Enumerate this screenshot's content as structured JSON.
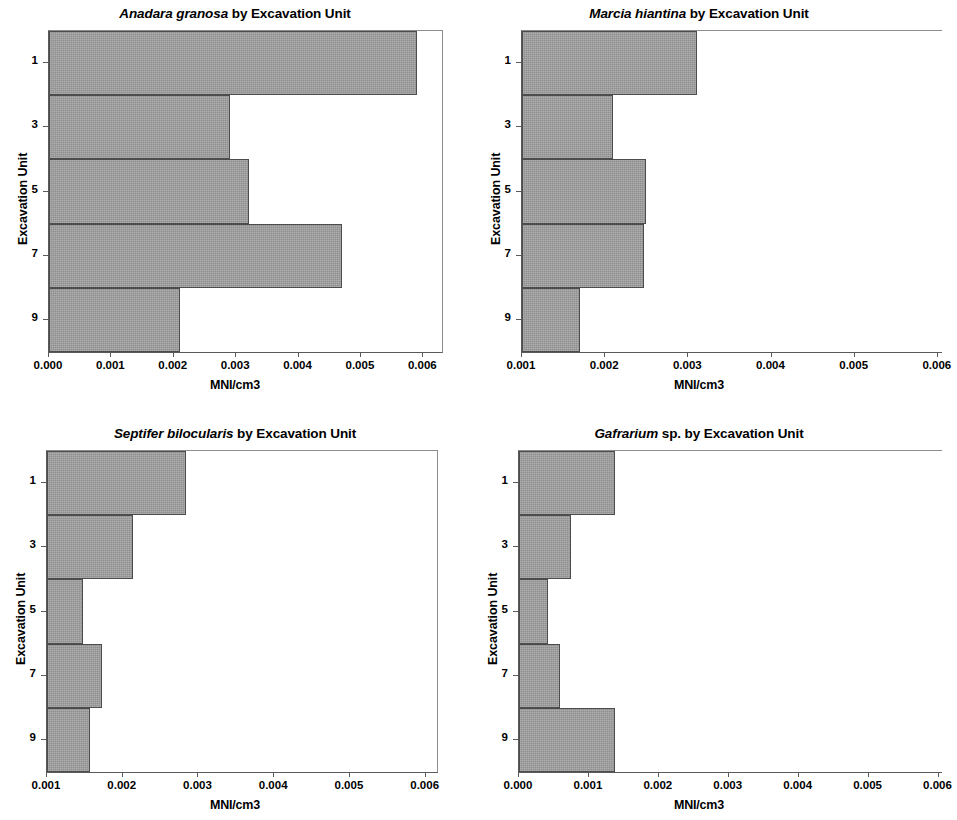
{
  "figure": {
    "axis_title_x": "MNI/cm3",
    "axis_title_y": "Excavation Unit",
    "bar_color": "#9a9a9a",
    "bar_edge_color": "#4c4c4c",
    "title_suffix": "by Excavation Unit"
  },
  "panels": [
    {
      "key": "tl",
      "title_species": "Anadara granosa",
      "title_rest": "by Excavation Unit",
      "title_full": "Anadara granosa  by Excavation Unit"
    },
    {
      "key": "tr",
      "title_species": "Marcia hiantina",
      "title_rest": "by Excavation Unit",
      "title_full": "Marcia hiantina by Excavation Unit"
    },
    {
      "key": "bl",
      "title_species": "Septifer bilocularis",
      "title_rest": "by Excavation Unit",
      "title_full": "Septifer bilocularis  by Excavation Unit"
    },
    {
      "key": "br",
      "title_species": "Gafrarium",
      "title_rest": "sp. by Excavation Unit",
      "title_full": "Gafrarium sp. by Excavation Unit"
    }
  ],
  "chart_data": [
    {
      "type": "bar",
      "orientation": "horizontal",
      "title": "Anadara granosa  by Excavation Unit",
      "xlabel": "MNI/cm3",
      "ylabel": "Excavation Unit",
      "categories": [
        "1",
        "",
        "3",
        "",
        "5",
        "",
        "7",
        "",
        "9"
      ],
      "ytick_labels": [
        "1",
        "3",
        "5",
        "7",
        "9"
      ],
      "values": [
        0.0059,
        0.0029,
        0.0032,
        0.0047,
        0.0021
      ],
      "xlim": [
        0.0,
        0.0063
      ],
      "xticks": [
        0.0,
        0.001,
        0.002,
        0.003,
        0.004,
        0.005,
        0.006
      ],
      "xtick_labels": [
        "0.000",
        "0.001",
        "0.002",
        "0.003",
        "0.004",
        "0.005",
        "0.006"
      ],
      "grid": false,
      "legend": "none",
      "clipped_right": false
    },
    {
      "type": "bar",
      "orientation": "horizontal",
      "title": "Marcia hiantina by Excavation Unit",
      "xlabel": "MNI/cm3",
      "ylabel": "Excavation Unit",
      "ytick_labels": [
        "1",
        "3",
        "5",
        "7",
        "9"
      ],
      "values": [
        0.0031,
        0.0021,
        0.00249,
        0.00247,
        0.0017
      ],
      "xlim": [
        0.001,
        0.00605
      ],
      "xticks": [
        0.001,
        0.002,
        0.003,
        0.004,
        0.005,
        0.006
      ],
      "xtick_labels": [
        "0.001",
        "0.002",
        "0.003",
        "0.004",
        "0.005",
        "0.006"
      ],
      "grid": false,
      "legend": "none",
      "clipped_right": true
    },
    {
      "type": "bar",
      "orientation": "horizontal",
      "title": "Septifer bilocularis  by Excavation Unit",
      "xlabel": "MNI/cm3",
      "ylabel": "Excavation Unit",
      "ytick_labels": [
        "1",
        "3",
        "5",
        "7",
        "9"
      ],
      "values": [
        0.00284,
        0.00214,
        0.00147,
        0.00173,
        0.00157
      ],
      "xlim": [
        0.001,
        0.00615
      ],
      "xticks": [
        0.001,
        0.002,
        0.003,
        0.004,
        0.005,
        0.006
      ],
      "xtick_labels": [
        "0.001",
        "0.002",
        "0.003",
        "0.004",
        "0.005",
        "0.006"
      ],
      "grid": false,
      "legend": "none",
      "clipped_right": false
    },
    {
      "type": "bar",
      "orientation": "horizontal",
      "title": "Gafrarium sp. by Excavation Unit",
      "xlabel": "MNI/cm3",
      "ylabel": "Excavation Unit",
      "ytick_labels": [
        "1",
        "3",
        "5",
        "7",
        "9"
      ],
      "values": [
        0.00137,
        0.00075,
        0.00042,
        0.00058,
        0.00137
      ],
      "xlim": [
        0.0,
        0.00605
      ],
      "xticks": [
        0.0,
        0.001,
        0.002,
        0.003,
        0.004,
        0.005,
        0.006
      ],
      "xtick_labels": [
        "0.000",
        "0.001",
        "0.002",
        "0.003",
        "0.004",
        "0.005",
        "0.006"
      ],
      "grid": false,
      "legend": "none",
      "clipped_right": true
    }
  ]
}
